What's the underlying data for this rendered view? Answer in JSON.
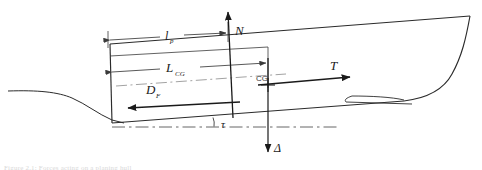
{
  "figure": {
    "kind": "planing-hull-force-diagram",
    "caption": "Figure 2.1: Forces acting on a planing hull"
  },
  "colors": {
    "hull_line": "#2b2b2b",
    "dimension_line": "#3a3a3a",
    "force_line": "#1a1a1a",
    "waterline": "#2b2b2b",
    "datum_line": "#555555",
    "keel_dashdot": "#8a8a8a",
    "label_text": "#1a1a1a",
    "caption_text": "#d8d8d8",
    "background": "#ffffff"
  },
  "labels": {
    "normal_force": "N",
    "thrust": "T",
    "friction_drag": "D",
    "friction_drag_sub": "F",
    "displacement": "Δ",
    "trim_angle": "τ",
    "center_of_gravity": "CG",
    "pressure_length": "l",
    "pressure_length_sub": "p",
    "lcg": "L",
    "lcg_sub": "CG"
  },
  "forces": [
    {
      "symbol": "N",
      "name": "normal-force",
      "direction": "up",
      "description": "Hydrodynamic normal force perpendicular to keel"
    },
    {
      "symbol": "T",
      "name": "thrust",
      "direction": "right",
      "description": "Propulsive thrust force"
    },
    {
      "symbol": "D",
      "name": "friction-drag",
      "subscript": "F",
      "direction": "left",
      "description": "Frictional drag along the wetted surface"
    },
    {
      "symbol": "Δ",
      "name": "displacement-weight",
      "direction": "down",
      "description": "Weight / displacement acting at CG"
    }
  ],
  "dimensions": [
    {
      "symbol": "l",
      "subscript": "p",
      "name": "pressure-center-length",
      "description": "Longitudinal distance from transom to centre of pressure"
    },
    {
      "symbol": "L",
      "subscript": "CG",
      "name": "lcg-length",
      "description": "Longitudinal distance from transom to centre of gravity"
    }
  ],
  "angles": [
    {
      "symbol": "τ",
      "name": "trim-angle",
      "description": "Trim angle between keel and horizontal datum"
    }
  ]
}
